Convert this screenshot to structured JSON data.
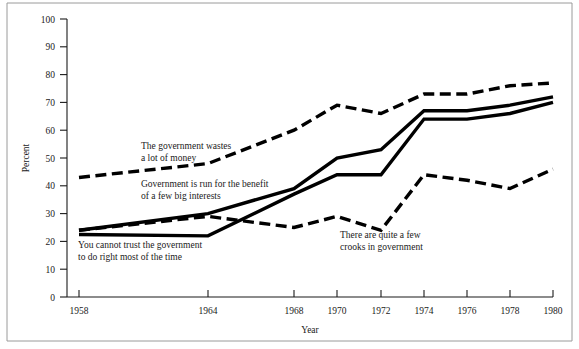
{
  "chart_data": {
    "type": "line",
    "title": "",
    "xlabel": "Year",
    "ylabel": "Percent",
    "xlim": [
      1958,
      1980
    ],
    "ylim": [
      0,
      100
    ],
    "grid": false,
    "legend": "inline-annotations",
    "x_ticks": [
      1958,
      1964,
      1968,
      1970,
      1972,
      1974,
      1976,
      1978,
      1980
    ],
    "x_tick_labels": [
      "1958",
      "1964",
      "1968",
      "1970",
      "1972",
      "1974",
      "1976",
      "1978",
      "1980"
    ],
    "y_ticks": [
      0,
      10,
      20,
      30,
      40,
      50,
      60,
      70,
      80,
      90,
      100
    ],
    "y_tick_labels": [
      "0",
      "10",
      "20",
      "30",
      "40",
      "50",
      "60",
      "70",
      "80",
      "90",
      "100"
    ],
    "series": [
      {
        "name": "The government wastes a lot of money",
        "style": "dashed",
        "annotation": "The government wastes\na lot of money",
        "annotation_line1": "The government wastes",
        "annotation_line2": "a lot of money",
        "x": [
          1958,
          1964,
          1968,
          1970,
          1972,
          1974,
          1976,
          1978,
          1980
        ],
        "values": [
          43,
          48,
          60,
          69,
          66,
          73,
          73,
          76,
          77
        ]
      },
      {
        "name": "Government is run for the benefit of a few big interests",
        "style": "solid",
        "annotation": "Government is run for the benefit\nof a few big interests",
        "annotation_line1": "Government is run for the benefit",
        "annotation_line2": "of a few big interests",
        "x": [
          1958,
          1964,
          1968,
          1970,
          1972,
          1974,
          1976,
          1978,
          1980
        ],
        "values": [
          24,
          30,
          39,
          50,
          53,
          67,
          67,
          69,
          72
        ]
      },
      {
        "name": "You cannot trust the government to do right most of the time",
        "style": "solid",
        "annotation": "You cannot trust the government\nto do right most of the time",
        "annotation_line1": "You cannot trust the government",
        "annotation_line2": "to do right most of the time",
        "x": [
          1958,
          1964,
          1968,
          1970,
          1972,
          1974,
          1976,
          1978,
          1980
        ],
        "values": [
          22.5,
          22,
          37,
          44,
          44,
          64,
          64,
          66,
          70
        ]
      },
      {
        "name": "There are quite a few crooks in government",
        "style": "dashed",
        "annotation": "There are quite a few\ncrooks in government",
        "annotation_line1": "There are quite a few",
        "annotation_line2": "crooks in government",
        "x": [
          1958,
          1964,
          1968,
          1970,
          1972,
          1974,
          1976,
          1978,
          1980
        ],
        "values": [
          24,
          29,
          25,
          29,
          24,
          44,
          42,
          39,
          46
        ]
      }
    ]
  },
  "axes": {
    "ylabel": "Percent",
    "xlabel": "Year"
  },
  "annotations": {
    "wastes_l1": "The government wastes",
    "wastes_l2": "a lot of money",
    "interests_l1": "Government is run for the benefit",
    "interests_l2": "of a few big interests",
    "trust_l1": "You cannot trust the government",
    "trust_l2": "to do right most of the time",
    "crooks_l1": "There are quite a few",
    "crooks_l2": "crooks in government"
  },
  "colors": {
    "line": "#000000",
    "axis": "#1a1a1a",
    "background": "#ffffff",
    "frame": "#9a9a9a"
  }
}
